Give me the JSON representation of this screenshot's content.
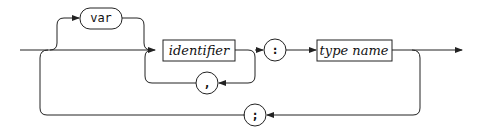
{
  "diagram": {
    "type": "syntax-railroad",
    "terminals": {
      "var": "var",
      "comma": ",",
      "colon": ":",
      "semicolon": ";"
    },
    "nonterminals": {
      "identifier": "identifier",
      "type_name": "type name"
    },
    "stroke_color": "#222222",
    "background": "#ffffff"
  }
}
